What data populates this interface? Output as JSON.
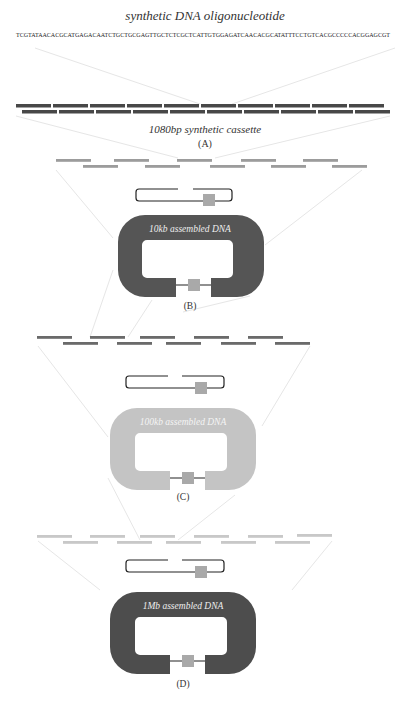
{
  "figure": {
    "title": "synthetic DNA oligonucleotide",
    "sequence": "TCGTATAACACGCATGAGACAATCTGCTGCGAGTTGCTCTCGCTCATTGTGGAGATCAACACGCATATTTCCTGTCACGCCCCCACGGAGCGT",
    "panels": [
      {
        "id": "A",
        "label": "(A)",
        "caption": "1080bp synthetic cassette",
        "bar_color": "#4a4a4a"
      },
      {
        "id": "B",
        "label": "(B)",
        "caption": "10kb assembled DNA",
        "ring_color": "#555555",
        "bar_color": "#9a9a9a"
      },
      {
        "id": "C",
        "label": "(C)",
        "caption": "100kb assembled DNA",
        "ring_color": "#c4c4c4",
        "bar_color": "#6e6e6e"
      },
      {
        "id": "D",
        "label": "(D)",
        "caption": "1Mb assembled DNA",
        "ring_color": "#4d4d4d",
        "bar_color": "#c8c8c8"
      }
    ],
    "colors": {
      "guide_line": "#e4e4e4",
      "insert_box": "#a9a9a9",
      "ring_text": "#eeeeee",
      "ring_text_light": "#f4f4f4"
    }
  }
}
